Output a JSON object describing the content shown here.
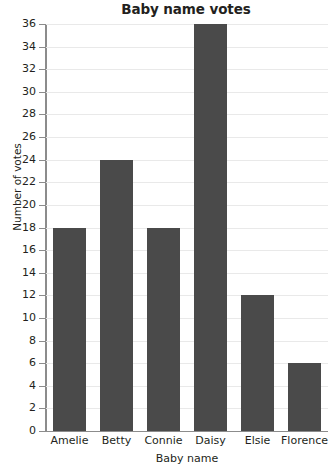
{
  "chart_data": {
    "type": "bar",
    "title": "Baby name votes",
    "xlabel": "Baby name",
    "ylabel": "Number of votes",
    "categories": [
      "Amelie",
      "Betty",
      "Connie",
      "Daisy",
      "Elsie",
      "Florence"
    ],
    "values": [
      18,
      24,
      18,
      36,
      12,
      6
    ],
    "ylim": [
      0,
      36
    ],
    "ytick_step": 2,
    "yticks": [
      0,
      2,
      4,
      6,
      8,
      10,
      12,
      14,
      16,
      18,
      20,
      22,
      24,
      26,
      28,
      30,
      32,
      34,
      36
    ],
    "ytick_labels": [
      "0",
      "2",
      "4",
      "6",
      "8",
      "10",
      "12",
      "14",
      "16",
      "18",
      "20",
      "22",
      "24",
      "26",
      "28",
      "30",
      "32",
      "34",
      "36"
    ],
    "grid": true,
    "grid_axis": "y",
    "legend": false,
    "legend_position": "none",
    "bar_color": "#4a4a4a",
    "gridline_color": "#e9e9e9",
    "axis_color": "#8c8c8c",
    "text_color": "#231f20",
    "background_color": "#ffffff"
  }
}
